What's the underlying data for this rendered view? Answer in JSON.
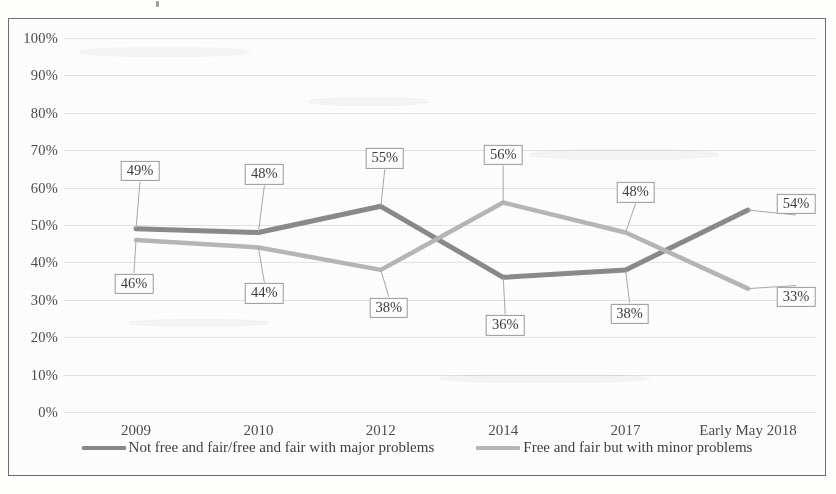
{
  "chart_data": {
    "type": "line",
    "title": "",
    "xlabel": "",
    "ylabel": "",
    "ylim": [
      0,
      100
    ],
    "grid": true,
    "legend_position": "bottom",
    "categories": [
      "2009",
      "2010",
      "2012",
      "2014",
      "2017",
      "Early May 2018"
    ],
    "ytick_labels": [
      "100%",
      "90%",
      "80%",
      "70%",
      "60%",
      "50%",
      "40%",
      "30%",
      "20%",
      "10%",
      "0%"
    ],
    "ytick_values": [
      100,
      90,
      80,
      70,
      60,
      50,
      40,
      30,
      20,
      10,
      0
    ],
    "series": [
      {
        "name": "Not free and fair/free and fair with major problems",
        "color": "#8a8a8a",
        "values": [
          49,
          48,
          55,
          36,
          38,
          54
        ],
        "data_labels": [
          "49%",
          "48%",
          "55%",
          "36%",
          "38%",
          "54%"
        ]
      },
      {
        "name": "Free and fair but with minor problems",
        "color": "#b6b6b6",
        "values": [
          46,
          44,
          38,
          56,
          48,
          33
        ],
        "data_labels": [
          "46%",
          "44%",
          "38%",
          "56%",
          "48%",
          "33%"
        ]
      }
    ]
  },
  "legend": {
    "items": [
      {
        "label": "Not free and fair/free and fair with major problems",
        "color": "#8a8a8a"
      },
      {
        "label": "Free and fair but with minor problems",
        "color": "#b6b6b6"
      }
    ]
  },
  "colors": {
    "series_major_problems": "#8a8a8a",
    "series_minor_problems": "#b6b6b6",
    "gridline": "#e4e4e2",
    "frame_border": "#6f6f6f",
    "label_box_border": "#9a9a9a",
    "text": "#3f3f3f",
    "page_background": "#fdfdfc"
  }
}
